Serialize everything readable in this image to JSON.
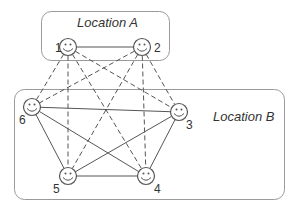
{
  "diagram": {
    "colors": {
      "stroke": "#555555",
      "box": "#9a9a9a",
      "text": "#333333",
      "background": "#ffffff"
    },
    "locations": [
      {
        "id": "A",
        "label": "Location A",
        "box": {
          "x": 41,
          "y": 11,
          "w": 128,
          "h": 49
        },
        "label_pos": {
          "x": 77,
          "y": 27
        }
      },
      {
        "id": "B",
        "label": "Location B",
        "box": {
          "x": 14,
          "y": 89,
          "w": 270,
          "h": 110
        },
        "label_pos": {
          "x": 213,
          "y": 121
        }
      }
    ],
    "nodes": [
      {
        "id": "1",
        "label": "1",
        "icon": "smiley-face-icon",
        "location": "A",
        "x": 68,
        "y": 47,
        "label_x": 55,
        "label_y": 52
      },
      {
        "id": "2",
        "label": "2",
        "icon": "smiley-face-icon",
        "location": "A",
        "x": 142,
        "y": 47,
        "label_x": 154,
        "label_y": 52
      },
      {
        "id": "3",
        "label": "3",
        "icon": "smiley-face-icon",
        "location": "B",
        "x": 179,
        "y": 112,
        "label_x": 186,
        "label_y": 129
      },
      {
        "id": "4",
        "label": "4",
        "icon": "smiley-face-icon",
        "location": "B",
        "x": 146,
        "y": 176,
        "label_x": 154,
        "label_y": 193
      },
      {
        "id": "5",
        "label": "5",
        "icon": "smiley-face-icon",
        "location": "B",
        "x": 68,
        "y": 176,
        "label_x": 53,
        "label_y": 193
      },
      {
        "id": "6",
        "label": "6",
        "icon": "smiley-face-icon",
        "location": "B",
        "x": 32,
        "y": 107,
        "label_x": 19,
        "label_y": 124
      }
    ],
    "edges": [
      {
        "from": "1",
        "to": "2",
        "style": "solid"
      },
      {
        "from": "1",
        "to": "6",
        "style": "dashed"
      },
      {
        "from": "1",
        "to": "5",
        "style": "dashed"
      },
      {
        "from": "1",
        "to": "4",
        "style": "dashed"
      },
      {
        "from": "1",
        "to": "3",
        "style": "dashed"
      },
      {
        "from": "2",
        "to": "6",
        "style": "dashed"
      },
      {
        "from": "2",
        "to": "5",
        "style": "dashed"
      },
      {
        "from": "2",
        "to": "4",
        "style": "dashed"
      },
      {
        "from": "2",
        "to": "3",
        "style": "dashed"
      },
      {
        "from": "6",
        "to": "3",
        "style": "solid"
      },
      {
        "from": "6",
        "to": "5",
        "style": "solid"
      },
      {
        "from": "6",
        "to": "4",
        "style": "solid"
      },
      {
        "from": "3",
        "to": "5",
        "style": "solid"
      },
      {
        "from": "3",
        "to": "4",
        "style": "solid"
      },
      {
        "from": "5",
        "to": "4",
        "style": "solid"
      }
    ],
    "node_radius": 8.5
  }
}
